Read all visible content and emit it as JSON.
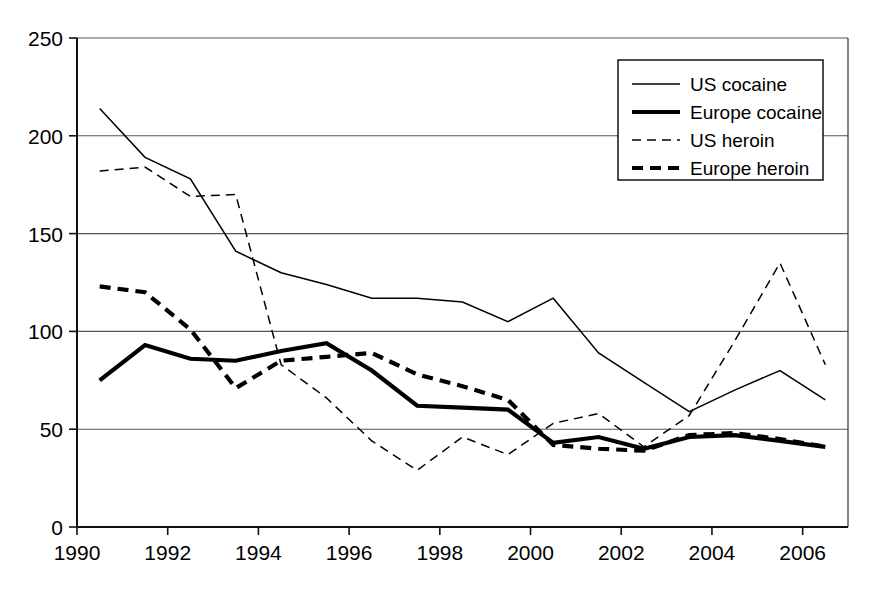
{
  "chart_data": {
    "type": "line",
    "title": "",
    "subtitle": "",
    "xlabel": "",
    "ylabel": "",
    "xlim": [
      1990,
      2007
    ],
    "ylim": [
      0,
      250
    ],
    "grid": true,
    "legend_position": "top-right",
    "y_ticks": [
      0,
      50,
      100,
      150,
      200,
      250
    ],
    "y_tick_labels": [
      "0",
      "50",
      "100",
      "150",
      "200",
      "250"
    ],
    "x_ticks": [
      1990,
      1992,
      1994,
      1996,
      1998,
      2000,
      2002,
      2004,
      2006
    ],
    "x_tick_labels": [
      "1990",
      "1992",
      "1994",
      "1996",
      "1998",
      "2000",
      "2002",
      "2004",
      "2006"
    ],
    "x": [
      1990.5,
      1991.5,
      1992.5,
      1993.5,
      1994.5,
      1995.5,
      1996.5,
      1997.5,
      1998.5,
      1999.5,
      2000.5,
      2001.5,
      2002.5,
      2003.5,
      2004.5,
      2005.5,
      2006.5
    ],
    "series": [
      {
        "name": "US cocaine",
        "style": "thin-solid",
        "stroke_width": 1.5,
        "dash": "none",
        "values": [
          214,
          189,
          178,
          141,
          130,
          124,
          117,
          117,
          115,
          105,
          117,
          89,
          74,
          59,
          70,
          80,
          65
        ]
      },
      {
        "name": "Europe cocaine",
        "style": "thick-solid",
        "stroke_width": 4.2,
        "dash": "none",
        "values": [
          75,
          93,
          86,
          85,
          90,
          94,
          80,
          62,
          61,
          60,
          43,
          46,
          40,
          46,
          47,
          44,
          41
        ]
      },
      {
        "name": "US heroin",
        "style": "thin-dashed",
        "stroke_width": 1.5,
        "dash": "9,6",
        "values": [
          182,
          184,
          169,
          170,
          83,
          66,
          44,
          29,
          46,
          37,
          53,
          58,
          41,
          57,
          95,
          135,
          83
        ]
      },
      {
        "name": "Europe heroin",
        "style": "thick-dashed",
        "stroke_width": 4.2,
        "dash": "11,7",
        "values": [
          123,
          120,
          101,
          71,
          85,
          87,
          89,
          78,
          72,
          65,
          42,
          40,
          39,
          47,
          48,
          45,
          41
        ]
      }
    ]
  },
  "legend": {
    "entries": [
      {
        "label": "US cocaine"
      },
      {
        "label": "Europe cocaine"
      },
      {
        "label": "US heroin"
      },
      {
        "label": "Europe heroin"
      }
    ]
  },
  "colors": {
    "ink": "#000000",
    "grid": "#555555",
    "background": "#ffffff"
  }
}
